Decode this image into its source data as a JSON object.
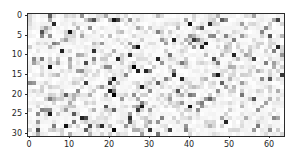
{
  "figure": {
    "width": 292,
    "height": 166,
    "background_color": "#ffffff",
    "axes_edge_color": "#2b2b2b",
    "tick_label_color": "#262626"
  },
  "axes": {
    "x": {
      "label": "",
      "ticks": [
        0,
        10,
        20,
        30,
        40,
        50,
        60
      ],
      "tick_labels": [
        "0",
        "10",
        "20",
        "30",
        "40",
        "50",
        "60"
      ],
      "lim": [
        -0.5,
        63.5
      ]
    },
    "y": {
      "label": "",
      "ticks": [
        0,
        5,
        10,
        15,
        20,
        25,
        30
      ],
      "tick_labels": [
        "0",
        "5",
        "10",
        "15",
        "20",
        "25",
        "30"
      ],
      "lim": [
        30.5,
        -0.5
      ],
      "inverted": true
    }
  },
  "chart_data": {
    "type": "heatmap",
    "title": "",
    "xlabel": "",
    "ylabel": "",
    "colormap": "gray_r",
    "colormap_low_color": "#ffffff",
    "colormap_high_color": "#000000",
    "grid": false,
    "legend": false,
    "colorbar": false,
    "n_rows": 31,
    "n_cols": 64,
    "xlim": [
      -0.5,
      63.5
    ],
    "ylim": [
      30.5,
      -0.5
    ],
    "vmin": 0,
    "vmax": 1,
    "value_distribution": {
      "near_white_fraction": 0.62,
      "light_gray_fraction": 0.24,
      "mid_gray_fraction": 0.1,
      "dark_fraction": 0.04
    },
    "seed": 20240917
  }
}
